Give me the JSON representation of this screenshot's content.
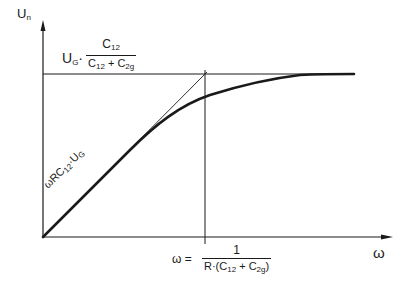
{
  "diagram": {
    "y_axis_label": "U",
    "y_axis_label_sub": "n",
    "x_axis_label": "ω",
    "asymptote_label": {
      "prefix": "U",
      "prefix_sub": "G",
      "dot": "·",
      "numerator": "C",
      "numerator_sub": "12",
      "denominator_a": "C",
      "denominator_a_sub": "12",
      "plus": " + ",
      "denominator_b": "C",
      "denominator_b_sub": "2g"
    },
    "slope_label": {
      "text": "ωRC",
      "sub": "12",
      "suffix": "·U",
      "suffix_sub": "G"
    },
    "corner_frequency_label": {
      "lhs": "ω  =",
      "numerator": "1",
      "denominator_prefix": "R·(C",
      "denominator_sub1": "12",
      "denominator_mid": " + C",
      "denominator_sub2": "2g",
      "denominator_suffix": ")"
    },
    "colors": {
      "ink": "#1a1a1a",
      "background": "#ffffff"
    }
  }
}
